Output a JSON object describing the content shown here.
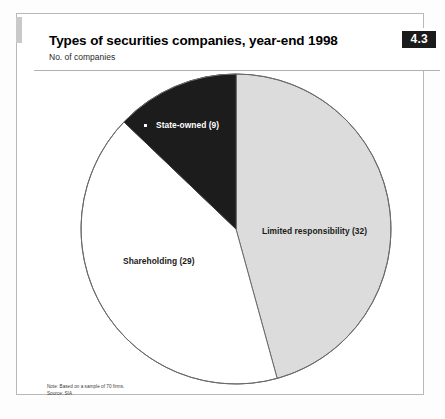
{
  "figure": {
    "number": "4.3",
    "title": "Types of securities companies, year-end 1998",
    "subtitle": "No. of companies",
    "note": "Note: Based on a sample of 70 firms.",
    "source": "Source: SIA"
  },
  "labels": {
    "limited": "Limited responsibility (32)",
    "shareholding": "Shareholding (29)",
    "state_owned": "State-owned (9)"
  },
  "chart_data": {
    "type": "pie",
    "title": "Types of securities companies, year-end 1998",
    "subtitle": "No. of companies",
    "ylabel": "No. of companies",
    "xlabel": "",
    "total": 70,
    "start_angle_deg": 0,
    "direction": "clockwise",
    "legend": "inside-slices",
    "grid": false,
    "categories": [
      "Limited responsibility",
      "Shareholding",
      "State-owned"
    ],
    "values": [
      32,
      29,
      9
    ],
    "labels": [
      "Limited responsibility (32)",
      "Shareholding (29)",
      "State-owned (9)"
    ],
    "percentages": [
      45.7,
      41.4,
      12.9
    ],
    "colors": [
      "#dcdcdc",
      "#ffffff",
      "#1c1c1c"
    ],
    "slices": [
      {
        "name": "Limited responsibility",
        "value": 32,
        "percent": 45.7,
        "color": "#dcdcdc",
        "start_deg": 0.0,
        "end_deg": 164.6,
        "label_color": "#1a1a1a"
      },
      {
        "name": "Shareholding",
        "value": 29,
        "percent": 41.4,
        "color": "#ffffff",
        "start_deg": 164.6,
        "end_deg": 313.7,
        "label_color": "#1a1a1a"
      },
      {
        "name": "State-owned",
        "value": 9,
        "percent": 12.9,
        "color": "#1c1c1c",
        "start_deg": 313.7,
        "end_deg": 360.0,
        "label_color": "#ffffff"
      }
    ],
    "note": "Note: Based on a sample of 70 firms.",
    "source": "Source: SIA"
  },
  "colors": {
    "slice_limited": "#dcdcdc",
    "slice_shareholding": "#ffffff",
    "slice_state_owned": "#1c1c1c",
    "outline": "#6a6a6a",
    "badge_bg": "#1b1b1b",
    "frame": "#b8b8b8"
  }
}
